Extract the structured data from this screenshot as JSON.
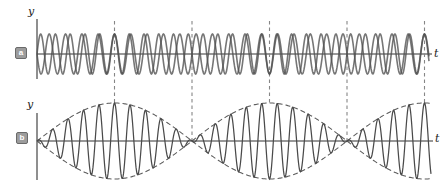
{
  "figure": {
    "width_px": 446,
    "height_px": 194,
    "background": "#ffffff"
  },
  "colors": {
    "wave": "#4f4f4f",
    "beat_wave": "#4a4a4a",
    "envelope": "#5a5a5a",
    "guide": "#868686",
    "axis": "#333333"
  },
  "panels": {
    "a": {
      "badge": "a",
      "y_axis_label": "y",
      "t_axis_label": "t"
    },
    "b": {
      "badge": "b",
      "y_axis_label": "y",
      "t_axis_label": "t"
    }
  },
  "chart_data": [
    {
      "type": "line",
      "panel": "a",
      "ylabel": "y",
      "xlabel": "t",
      "origin_px": {
        "x": 37,
        "y": 54
      },
      "x_end_px": 429,
      "x_axis_end_px": 432,
      "y_axis_top_px": 19,
      "y_axis_bottom_px": 79,
      "amplitude_px": 20,
      "series": [
        {
          "name": "wave-1-higher-frequency",
          "period_px": 14.76,
          "phase_sign": 1
        },
        {
          "name": "wave-2-lower-frequency",
          "period_px": 16.32,
          "phase_sign": -1
        }
      ],
      "constructive_interference_x_px": [
        114.5,
        269.5,
        424.5
      ],
      "destructive_interference_x_px": [
        37,
        192,
        347
      ]
    },
    {
      "type": "line",
      "panel": "b",
      "ylabel": "y",
      "xlabel": "t",
      "origin_px": {
        "x": 37,
        "y": 141
      },
      "x_end_px": 431,
      "x_axis_end_px": 433,
      "y_axis_top_px": 113,
      "y_axis_bottom_px": 180,
      "amplitude_px": 38,
      "carrier_period_px": 15.5,
      "envelope_node_spacing_px": 155,
      "envelope_node_x_px": [
        37,
        192,
        347
      ],
      "envelope_max_x_px": [
        114.5,
        269.5,
        424.5
      ],
      "series": [
        {
          "name": "resultant-beat-wave"
        },
        {
          "name": "beat-envelope-dashed"
        }
      ]
    }
  ],
  "guides": {
    "dash_px": "3.5 3",
    "lines": [
      {
        "x_px": 114.5,
        "y1_px": 21,
        "y2_px": 103,
        "kind": "constructive"
      },
      {
        "x_px": 192,
        "y1_px": 21,
        "y2_px": 141,
        "kind": "destructive"
      },
      {
        "x_px": 269.5,
        "y1_px": 21,
        "y2_px": 103,
        "kind": "constructive"
      },
      {
        "x_px": 347,
        "y1_px": 21,
        "y2_px": 141,
        "kind": "destructive"
      },
      {
        "x_px": 424.5,
        "y1_px": 21,
        "y2_px": 103,
        "kind": "constructive"
      }
    ]
  }
}
